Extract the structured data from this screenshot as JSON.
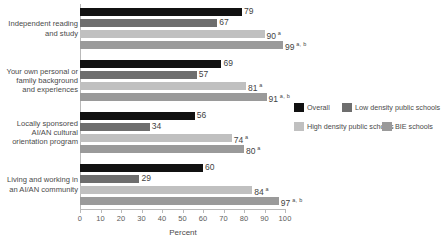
{
  "chart_data": {
    "type": "bar",
    "orientation": "horizontal",
    "title": "",
    "xlabel": "Percent",
    "ylabel": "",
    "xlim": [
      0,
      100
    ],
    "grid": false,
    "legend_position": "right",
    "tick_labels": [
      "0",
      "10",
      "20",
      "30",
      "40",
      "50",
      "60",
      "70",
      "80",
      "90",
      "100"
    ],
    "tick_values": [
      0,
      10,
      20,
      30,
      40,
      50,
      60,
      70,
      80,
      90,
      100
    ],
    "categories": [
      "Independent reading and study",
      "Your own personal or family background and experiences",
      "Locally sponsored AI/AN cultural orientation program",
      "Living and working in an AI/AN community"
    ],
    "category_label_lines": [
      [
        "Independent reading",
        "and study"
      ],
      [
        "Your own personal or",
        "family background",
        "and experiences"
      ],
      [
        "Locally sponsored",
        "AI/AN cultural",
        "orientation program"
      ],
      [
        "Living and working in",
        "an AI/AN community"
      ]
    ],
    "series": [
      {
        "name": "Overall",
        "color": "#111111",
        "values": [
          79,
          69,
          56,
          60
        ],
        "labels": [
          "79",
          "69",
          "56",
          "60"
        ],
        "annotations": [
          "",
          "",
          "",
          ""
        ]
      },
      {
        "name": "Low density public schools",
        "color": "#6e6e6e",
        "values": [
          67,
          57,
          34,
          29
        ],
        "labels": [
          "67",
          "57",
          "34",
          "29"
        ],
        "annotations": [
          "",
          "",
          "",
          ""
        ]
      },
      {
        "name": "High density public schools",
        "color": "#c0c0c0",
        "values": [
          90,
          81,
          74,
          84
        ],
        "labels": [
          "90",
          "81",
          "74",
          "84"
        ],
        "annotations": [
          "a",
          "a",
          "a",
          "a"
        ]
      },
      {
        "name": "BIE schools",
        "color": "#9a9a9a",
        "values": [
          99,
          91,
          80,
          97
        ],
        "labels": [
          "99",
          "91",
          "80",
          "97"
        ],
        "annotations": [
          "a, b",
          "a, b",
          "a",
          "a, b"
        ]
      }
    ]
  },
  "legend": {
    "items": [
      {
        "label": "Overall",
        "color": "#111111"
      },
      {
        "label": "Low density public schools",
        "color": "#6e6e6e"
      },
      {
        "label": "High density public schools",
        "color": "#c0c0c0"
      },
      {
        "label": "BIE schools",
        "color": "#9a9a9a"
      }
    ]
  },
  "axis": {
    "x_title": "Percent"
  }
}
